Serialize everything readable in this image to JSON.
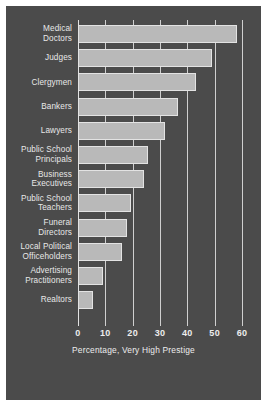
{
  "chart_data": {
    "type": "bar",
    "orientation": "horizontal",
    "title": "",
    "xlabel": "Percentage, Very High Prestige",
    "ylabel": "",
    "xlim": [
      0,
      60
    ],
    "xticks": [
      0,
      10,
      20,
      30,
      40,
      50,
      60
    ],
    "grid": true,
    "legend": false,
    "categories": [
      "Medical Doctors",
      "Judges",
      "Clergymen",
      "Bankers",
      "Lawyers",
      "Public School Principals",
      "Business Executives",
      "Public School Teachers",
      "Funeral Directors",
      "Local Political Officeholders",
      "Advertising Practitioners",
      "Realtors"
    ],
    "category_lines": [
      [
        "Medical",
        "Doctors"
      ],
      [
        "Judges"
      ],
      [
        "Clergymen"
      ],
      [
        "Bankers"
      ],
      [
        "Lawyers"
      ],
      [
        "Public School",
        "Principals"
      ],
      [
        "Business",
        "Executives"
      ],
      [
        "Public School",
        "Teachers"
      ],
      [
        "Funeral",
        "Directors"
      ],
      [
        "Local Political",
        "Officeholders"
      ],
      [
        "Advertising",
        "Practitioners"
      ],
      [
        "Realtors"
      ]
    ],
    "values": [
      58,
      49,
      43,
      36.5,
      32,
      25.5,
      24,
      19.5,
      18,
      16,
      9,
      5.5
    ]
  },
  "style": {
    "background": "#4b4b4b",
    "bar_fill": "#b9b9b9",
    "bar_edge": "#e3e3e3",
    "text": "#ededed",
    "gridline": "#cfcfcf",
    "page": "#ffffff"
  }
}
